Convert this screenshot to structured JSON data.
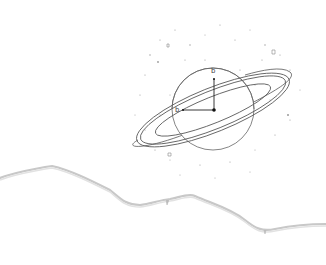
{
  "illustration": {
    "subject": "planet-with-ring",
    "axis_labels": {
      "vertical": "b",
      "horizontal": "b"
    },
    "colors": {
      "background": "#ffffff",
      "line": "#555555",
      "star": "#999999",
      "torn_edge": "#c8c8c8"
    }
  }
}
